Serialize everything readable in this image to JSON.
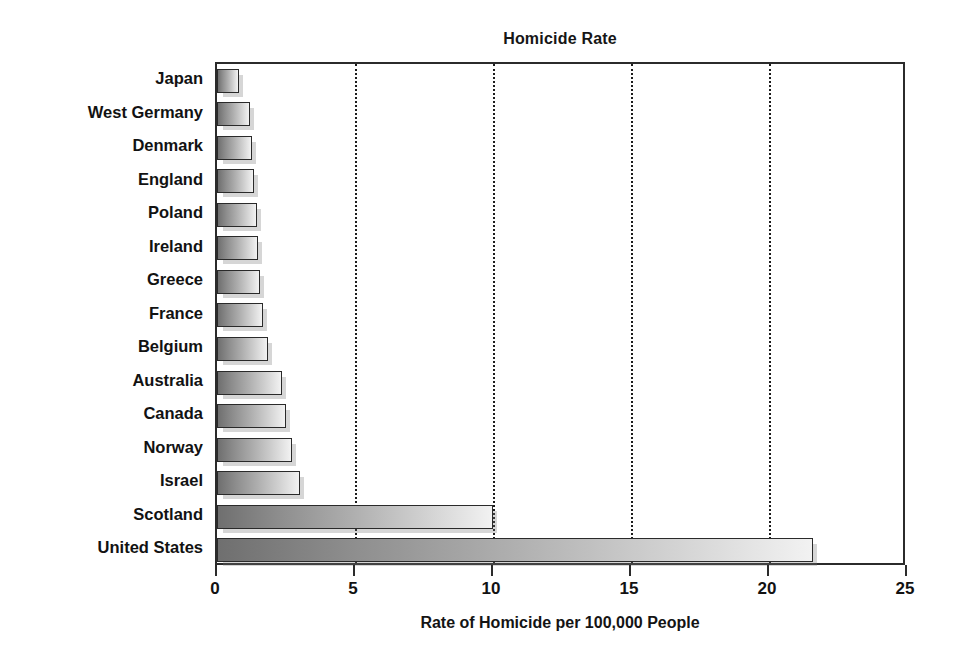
{
  "chart_data": {
    "type": "bar",
    "orientation": "horizontal",
    "title": "Homicide Rate",
    "xlabel": "Rate of Homicide per 100,000 People",
    "ylabel": "",
    "xlim": [
      0,
      25
    ],
    "xticks": [
      0,
      5,
      10,
      15,
      20,
      25
    ],
    "xtick_labels": [
      "0",
      "5",
      "10",
      "15",
      "20",
      "25"
    ],
    "gridlines": [
      5,
      10,
      15,
      20
    ],
    "grid": true,
    "grid_style": "dotted-vertical",
    "legend": null,
    "categories": [
      "Japan",
      "West Germany",
      "Denmark",
      "England",
      "Poland",
      "Ireland",
      "Greece",
      "France",
      "Belgium",
      "Australia",
      "Canada",
      "Norway",
      "Israel",
      "Scotland",
      "United States"
    ],
    "values": [
      0.8,
      1.2,
      1.25,
      1.35,
      1.45,
      1.5,
      1.55,
      1.65,
      1.85,
      2.35,
      2.5,
      2.7,
      3.0,
      10.0,
      21.6
    ],
    "bar_style": {
      "fill": "horizontal-gradient",
      "gradient_from": "#6f6f6f",
      "gradient_to": "#f2f2f2",
      "border": "#2a2a2a",
      "shadow": "#787878"
    }
  },
  "colors": {
    "background": "#ffffff",
    "axis": "#2b2b2b",
    "text": "#121212"
  }
}
